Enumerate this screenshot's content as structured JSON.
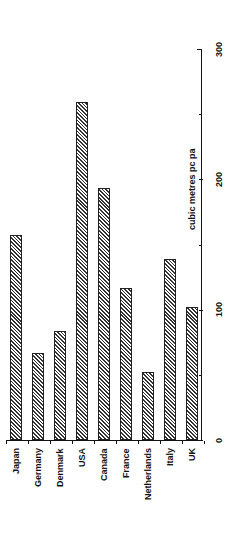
{
  "chart_data": {
    "type": "bar",
    "orientation": "vertical (image rotated 90°; category labels read bottom-to-top)",
    "title": "",
    "xlabel": "",
    "ylabel": "cubic metres pc pa",
    "categories": [
      "Japan",
      "Germany",
      "Denmark",
      "USA",
      "Canada",
      "France",
      "Netherlands",
      "Italy",
      "UK"
    ],
    "values": [
      157,
      67,
      84,
      259,
      193,
      117,
      52,
      139,
      102
    ],
    "ylim": [
      0,
      300
    ],
    "yticks": [
      0,
      100,
      200,
      300
    ],
    "ytick_labels": [
      "0",
      "100",
      "200",
      "300"
    ],
    "grid": false,
    "legend": null,
    "bar_fill": "diagonal hatch",
    "bar_color": "#333333"
  }
}
